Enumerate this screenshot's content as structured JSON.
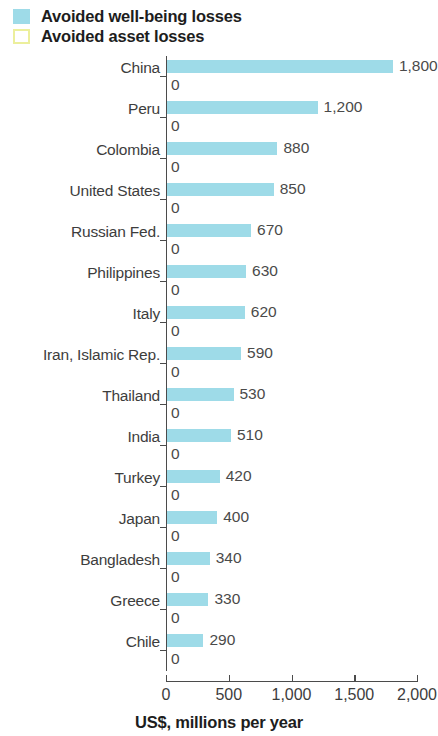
{
  "legend": {
    "items": [
      {
        "label": "Avoided well-being losses",
        "swatch": "wellbeing",
        "color": "#9edbe8"
      },
      {
        "label": "Avoided asset losses",
        "swatch": "asset",
        "color": "#ecef9c"
      }
    ]
  },
  "axis": {
    "title": "US$, millions per year",
    "tick_labels": [
      "0",
      "500",
      "1,000",
      "1,500",
      "2,000"
    ]
  },
  "chart_data": {
    "type": "bar",
    "orientation": "horizontal",
    "title": "",
    "subtitle": "",
    "xlabel": "US$, millions per year",
    "ylabel": "",
    "xlim": [
      0,
      2000
    ],
    "xticks": [
      0,
      500,
      1000,
      1500,
      2000
    ],
    "xtick_labels": [
      "0",
      "500",
      "1,000",
      "1,500",
      "2,000"
    ],
    "grid": false,
    "legend_position": "top-left",
    "categories": [
      "China",
      "Peru",
      "Colombia",
      "United States",
      "Russian Fed.",
      "Philippines",
      "Italy",
      "Iran, Islamic Rep.",
      "Thailand",
      "India",
      "Turkey",
      "Japan",
      "Bangladesh",
      "Greece",
      "Chile"
    ],
    "series": [
      {
        "name": "Avoided well-being losses",
        "color": "#9edbe8",
        "values": [
          1800,
          1200,
          880,
          850,
          670,
          630,
          620,
          590,
          530,
          510,
          420,
          400,
          340,
          330,
          290
        ],
        "value_labels": [
          "1,800",
          "1,200",
          "880",
          "850",
          "670",
          "630",
          "620",
          "590",
          "530",
          "510",
          "420",
          "400",
          "340",
          "330",
          "290"
        ]
      },
      {
        "name": "Avoided asset losses",
        "color": "#ecef9c",
        "values": [
          0,
          0,
          0,
          0,
          0,
          0,
          0,
          0,
          0,
          0,
          0,
          0,
          0,
          0,
          0
        ],
        "value_labels": [
          "0",
          "0",
          "0",
          "0",
          "0",
          "0",
          "0",
          "0",
          "0",
          "0",
          "0",
          "0",
          "0",
          "0",
          "0"
        ]
      }
    ]
  }
}
